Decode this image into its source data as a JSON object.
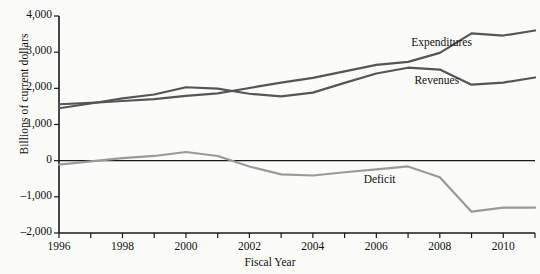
{
  "chart_data": {
    "type": "line",
    "title": "",
    "xlabel": "Fiscal Year",
    "ylabel": "Billions of current dollars",
    "x": [
      1996,
      1997,
      1998,
      1999,
      2000,
      2001,
      2002,
      2003,
      2004,
      2005,
      2006,
      2007,
      2008,
      2009,
      2010,
      2011
    ],
    "xlim": [
      1996,
      2011
    ],
    "ylim": [
      -2000,
      4000
    ],
    "grid": false,
    "legend_position": "inline-annotations",
    "xtick_labels": [
      "1996",
      "1998",
      "2000",
      "2002",
      "2004",
      "2006",
      "2008",
      "2010"
    ],
    "xtick_values": [
      1996,
      1998,
      2000,
      2002,
      2004,
      2006,
      2008,
      2010
    ],
    "ytick_labels": [
      "4,000",
      "3,000",
      "2,000",
      "1,000",
      "0",
      "-1,000",
      "-2,000"
    ],
    "ytick_values": [
      4000,
      3000,
      2000,
      1000,
      0,
      -1000,
      -2000
    ],
    "zero_line": true,
    "series": [
      {
        "name": "Expenditures",
        "color": "#565656",
        "label_x": 2007.1,
        "label_y": 3220,
        "values": [
          1560,
          1600,
          1650,
          1700,
          1790,
          1860,
          2010,
          2160,
          2290,
          2470,
          2650,
          2730,
          2980,
          3520,
          3460,
          3600
        ]
      },
      {
        "name": "Revenues",
        "color": "#565656",
        "label_x": 2007.2,
        "label_y": 2180,
        "values": [
          1450,
          1580,
          1720,
          1830,
          2030,
          1990,
          1850,
          1780,
          1880,
          2150,
          2410,
          2570,
          2520,
          2100,
          2160,
          2300
        ]
      },
      {
        "name": "Deficit",
        "color": "#9a9a9a",
        "label_x": 2005.6,
        "label_y": -560,
        "values": [
          -110,
          -20,
          70,
          130,
          240,
          130,
          -160,
          -380,
          -410,
          -320,
          -240,
          -160,
          -460,
          -1410,
          -1300,
          -1300
        ]
      }
    ]
  },
  "axis": {
    "spine_color": "#1a1a1a"
  }
}
